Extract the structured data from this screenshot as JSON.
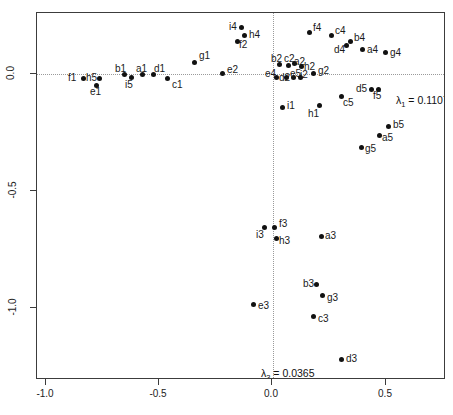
{
  "plot": {
    "type": "scatter",
    "frame": {
      "x_left": 36,
      "y_top": 12,
      "width": 409,
      "height": 367
    },
    "x_axis": {
      "ticks": [
        -1.0,
        -0.5,
        0.0,
        0.5
      ],
      "tick_labels": [
        "-1.0",
        "-0.5",
        "0.0",
        "0.5"
      ],
      "tick_px": [
        45,
        158,
        271,
        385
      ],
      "range": [
        -1.17,
        0.78
      ],
      "label": ""
    },
    "y_axis": {
      "ticks": [
        0.0,
        -0.5,
        -1.0
      ],
      "tick_labels": [
        "0.0",
        "-0.5",
        "-1.0"
      ],
      "tick_px": [
        73,
        190,
        307
      ],
      "range": [
        -1.3,
        0.27
      ],
      "label": ""
    },
    "gridlines": {
      "horizontal_at": 0.0,
      "vertical_at": 0.0,
      "style": "dotted",
      "color": "#9a9a9a"
    },
    "annotations": [
      {
        "name": "eigenvalue-1",
        "text": "= 0.1107",
        "symbol": "λ",
        "subscript": "1",
        "px": 395,
        "py": 93
      },
      {
        "name": "eigenvalue-3",
        "text": "= 0.0365",
        "symbol": "λ",
        "subscript": "3",
        "px": 260,
        "py": 366
      }
    ],
    "point_color": "#111111",
    "label_color": "#1a1a1a"
  },
  "chart_data": {
    "type": "scatter",
    "title": "",
    "xlabel": "",
    "ylabel": "",
    "xlim": [
      -1.17,
      0.78
    ],
    "ylim": [
      -1.3,
      0.27
    ],
    "grid": "dotted reference lines at x=0 and y=0",
    "legend": "none",
    "annotations": [
      "λ1 = 0.1107",
      "λ3 = 0.0365"
    ],
    "points": [
      {
        "label": "i4",
        "x": -0.137,
        "y": 0.201,
        "px": 240,
        "py": 26,
        "lx": 228,
        "ly": 21
      },
      {
        "label": "h4",
        "x": -0.124,
        "y": 0.167,
        "px": 243,
        "py": 34,
        "lx": 248,
        "ly": 29
      },
      {
        "label": "f2",
        "x": -0.155,
        "y": 0.141,
        "px": 236,
        "py": 40,
        "lx": 238,
        "ly": 39
      },
      {
        "label": "g1",
        "x": -0.345,
        "y": 0.051,
        "px": 193,
        "py": 61,
        "lx": 198,
        "ly": 50
      },
      {
        "label": "e2",
        "x": -0.221,
        "y": 0.004,
        "px": 221,
        "py": 72,
        "lx": 226,
        "ly": 64
      },
      {
        "label": "f1",
        "x": -0.836,
        "y": -0.017,
        "px": 82,
        "py": 77,
        "lx": 67,
        "ly": 72
      },
      {
        "label": "h5",
        "x": -0.765,
        "y": -0.017,
        "px": 98,
        "py": 77,
        "lx": 85,
        "ly": 72
      },
      {
        "label": "e1",
        "x": -0.779,
        "y": -0.047,
        "px": 95,
        "py": 84,
        "lx": 89,
        "ly": 86
      },
      {
        "label": "b1",
        "x": -0.655,
        "y": 0.0,
        "px": 123,
        "py": 73,
        "lx": 114,
        "ly": 63
      },
      {
        "label": "i5",
        "x": -0.624,
        "y": -0.013,
        "px": 130,
        "py": 76,
        "lx": 124,
        "ly": 79
      },
      {
        "label": "a1",
        "x": -0.575,
        "y": 0.0,
        "px": 141,
        "py": 73,
        "lx": 135,
        "ly": 63
      },
      {
        "label": "d1",
        "x": -0.527,
        "y": 0.0,
        "px": 152,
        "py": 73,
        "lx": 153,
        "ly": 63
      },
      {
        "label": "c1",
        "x": -0.465,
        "y": -0.017,
        "px": 166,
        "py": 77,
        "lx": 171,
        "ly": 79
      },
      {
        "label": "b2",
        "x": 0.031,
        "y": 0.043,
        "px": 278,
        "py": 63,
        "lx": 270,
        "ly": 53
      },
      {
        "label": "c2",
        "x": 0.071,
        "y": 0.038,
        "px": 287,
        "py": 64,
        "lx": 283,
        "ly": 53
      },
      {
        "label": "a2",
        "x": 0.097,
        "y": 0.047,
        "px": 293,
        "py": 62,
        "lx": 293,
        "ly": 56
      },
      {
        "label": "h2",
        "x": 0.128,
        "y": 0.034,
        "px": 300,
        "py": 65,
        "lx": 303,
        "ly": 61
      },
      {
        "label": "e4",
        "x": 0.018,
        "y": -0.013,
        "px": 275,
        "py": 76,
        "lx": 264,
        "ly": 68
      },
      {
        "label": "d2",
        "x": 0.062,
        "y": -0.013,
        "px": 285,
        "py": 76,
        "lx": 278,
        "ly": 72
      },
      {
        "label": "e5",
        "x": 0.093,
        "y": -0.013,
        "px": 292,
        "py": 76,
        "lx": 289,
        "ly": 68
      },
      {
        "label": "i2",
        "x": 0.124,
        "y": -0.013,
        "px": 299,
        "py": 76,
        "lx": 299,
        "ly": 69
      },
      {
        "label": "g2",
        "x": 0.181,
        "y": 0.004,
        "px": 312,
        "py": 72,
        "lx": 317,
        "ly": 65
      },
      {
        "label": "i1",
        "x": 0.044,
        "y": -0.141,
        "px": 281,
        "py": 106,
        "lx": 286,
        "ly": 100
      },
      {
        "label": "h1",
        "x": 0.208,
        "y": -0.132,
        "px": 318,
        "py": 104,
        "lx": 307,
        "ly": 108
      },
      {
        "label": "f4",
        "x": 0.164,
        "y": 0.179,
        "px": 308,
        "py": 31,
        "lx": 312,
        "ly": 22
      },
      {
        "label": "c4",
        "x": 0.261,
        "y": 0.167,
        "px": 330,
        "py": 34,
        "lx": 334,
        "ly": 25
      },
      {
        "label": "b4",
        "x": 0.345,
        "y": 0.141,
        "px": 349,
        "py": 40,
        "lx": 353,
        "ly": 32
      },
      {
        "label": "d4",
        "x": 0.327,
        "y": 0.124,
        "px": 345,
        "py": 44,
        "lx": 333,
        "ly": 44
      },
      {
        "label": "a4",
        "x": 0.398,
        "y": 0.107,
        "px": 361,
        "py": 48,
        "lx": 366,
        "ly": 44
      },
      {
        "label": "g4",
        "x": 0.5,
        "y": 0.094,
        "px": 384,
        "py": 51,
        "lx": 389,
        "ly": 47
      },
      {
        "label": "d5",
        "x": 0.438,
        "y": -0.064,
        "px": 370,
        "py": 88,
        "lx": 355,
        "ly": 83
      },
      {
        "label": "f5",
        "x": 0.469,
        "y": -0.064,
        "px": 377,
        "py": 88,
        "lx": 372,
        "ly": 90
      },
      {
        "label": "c5",
        "x": 0.305,
        "y": -0.094,
        "px": 340,
        "py": 95,
        "lx": 342,
        "ly": 97
      },
      {
        "label": "b5",
        "x": 0.513,
        "y": -0.222,
        "px": 387,
        "py": 125,
        "lx": 392,
        "ly": 119
      },
      {
        "label": "a5",
        "x": 0.473,
        "y": -0.261,
        "px": 378,
        "py": 134,
        "lx": 381,
        "ly": 132
      },
      {
        "label": "g5",
        "x": 0.394,
        "y": -0.312,
        "px": 360,
        "py": 146,
        "lx": 364,
        "ly": 143
      },
      {
        "label": "f3",
        "x": 0.009,
        "y": -0.654,
        "px": 273,
        "py": 226,
        "lx": 278,
        "ly": 218
      },
      {
        "label": "i3",
        "x": -0.035,
        "y": -0.654,
        "px": 263,
        "py": 226,
        "lx": 255,
        "ly": 229
      },
      {
        "label": "h3",
        "x": 0.018,
        "y": -0.701,
        "px": 275,
        "py": 237,
        "lx": 278,
        "ly": 235
      },
      {
        "label": "a3",
        "x": 0.217,
        "y": -0.692,
        "px": 320,
        "py": 235,
        "lx": 324,
        "ly": 230
      },
      {
        "label": "b3",
        "x": 0.195,
        "y": -0.897,
        "px": 315,
        "py": 283,
        "lx": 302,
        "ly": 278
      },
      {
        "label": "g3",
        "x": 0.221,
        "y": -0.945,
        "px": 321,
        "py": 294,
        "lx": 326,
        "ly": 292
      },
      {
        "label": "e3",
        "x": -0.084,
        "y": -0.983,
        "px": 252,
        "py": 303,
        "lx": 257,
        "ly": 300
      },
      {
        "label": "c3",
        "x": 0.181,
        "y": -1.034,
        "px": 312,
        "py": 315,
        "lx": 317,
        "ly": 313
      },
      {
        "label": "d3",
        "x": 0.305,
        "y": -1.218,
        "px": 340,
        "py": 358,
        "lx": 345,
        "ly": 353
      }
    ]
  }
}
